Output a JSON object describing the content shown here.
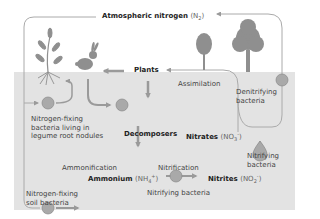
{
  "diagram": {
    "nodes": {
      "atmospheric": {
        "name": "Atmospheric nitrogen",
        "formula_prefix": "(N",
        "formula_sub": "2",
        "formula_suffix": ")"
      },
      "plants": {
        "name": "Plants"
      },
      "decomposers": {
        "name": "Decomposers"
      },
      "nitrates": {
        "name": "Nitrates",
        "formula_prefix": "(NO",
        "formula_sub": "3",
        "formula_sup": "-",
        "formula_suffix": ")"
      },
      "ammonium": {
        "name": "Ammonium",
        "formula_prefix": "(NH",
        "formula_sub": "4",
        "formula_sup": "+",
        "formula_suffix": ")"
      },
      "nitrites": {
        "name": "Nitrites",
        "formula_prefix": "(NO",
        "formula_sub": "2",
        "formula_sup": "-",
        "formula_suffix": ")"
      }
    },
    "processes": {
      "assimilation": "Assimilation",
      "ammonification": "Ammonification",
      "nitrification": "Nitrification"
    },
    "bacteria": {
      "legume_line1": "Nitrogen-fixing",
      "legume_line2": "bacteria living in",
      "legume_line3": "legume root nodules",
      "soil_line1": "Nitrogen-fixing",
      "soil_line2": "soil bacteria",
      "denitrifying_line1": "Denitrifying",
      "denitrifying_line2": "bacteria",
      "nitrifying_right_line1": "Nitrifying",
      "nitrifying_right_line2": "bacteria",
      "nitrifying_bottom": "Nitrifying bacteria"
    },
    "colors": {
      "soil": "#e3e3e3",
      "arrow": "#9a9a9a",
      "icon": "#8f8f8f",
      "text": "#444444"
    }
  }
}
